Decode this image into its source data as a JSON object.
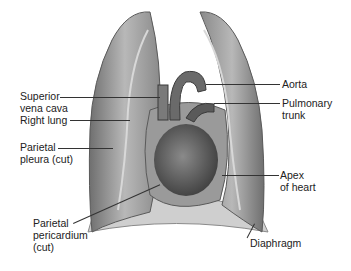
{
  "diagram": {
    "labels": {
      "superior_vena_cava": "Superior\nvena cava",
      "right_lung": "Right lung",
      "parietal_pleura": "Parietal\npleura (cut)",
      "parietal_pericardium": "Parietal\npericardium\n(cut)",
      "aorta": "Aorta",
      "pulmonary_trunk": "Pulmonary\ntrunk",
      "apex_of_heart": "Apex\nof heart",
      "diaphragm": "Diaphragm"
    },
    "colors": {
      "lung_fill": "#a8a8a8",
      "lung_shade": "#7a7a7a",
      "heart_fill": "#5a5a5a",
      "diaphragm_fill": "#c9c9c9",
      "leader_line": "#333333",
      "text": "#222222"
    }
  }
}
